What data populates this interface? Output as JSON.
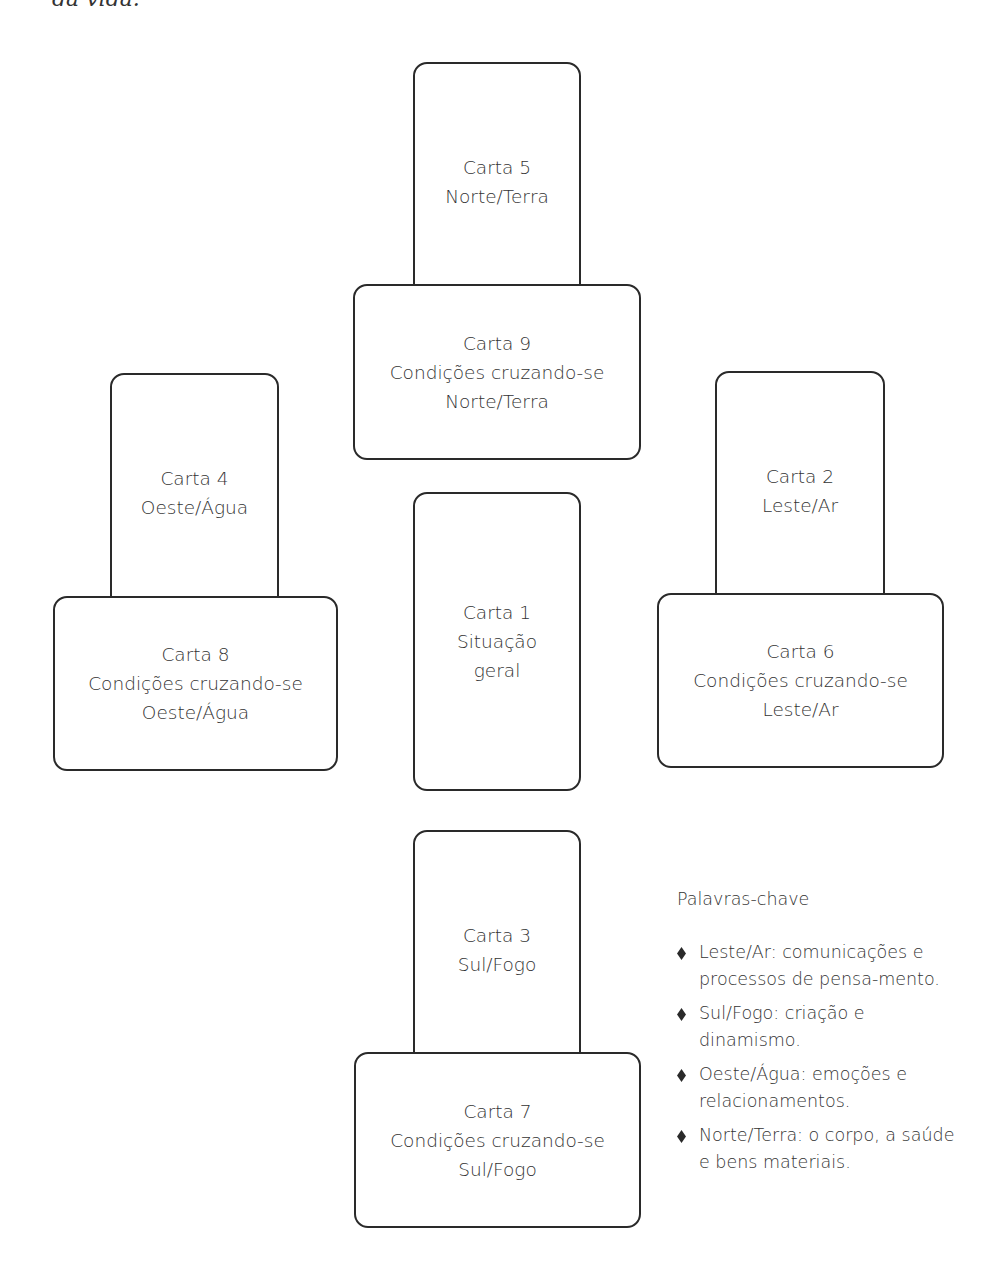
{
  "page": {
    "top_fragment": "da vida."
  },
  "cards": [
    {
      "id": "carta-5",
      "title": "Carta 5",
      "lines": [
        "Norte/Terra"
      ],
      "x": 413,
      "y": 62,
      "w": 168,
      "h": 240,
      "orientation": "vertical"
    },
    {
      "id": "carta-9",
      "title": "Carta 9",
      "lines": [
        "Condições cruzando-se",
        "Norte/Terra"
      ],
      "x": 353,
      "y": 284,
      "w": 288,
      "h": 176,
      "orientation": "horizontal"
    },
    {
      "id": "carta-4",
      "title": "Carta 4",
      "lines": [
        "Oeste/Água"
      ],
      "x": 110,
      "y": 373,
      "w": 169,
      "h": 240,
      "orientation": "vertical"
    },
    {
      "id": "carta-8",
      "title": "Carta 8",
      "lines": [
        "Condições cruzando-se",
        "Oeste/Água"
      ],
      "x": 53,
      "y": 596,
      "w": 285,
      "h": 175,
      "orientation": "horizontal"
    },
    {
      "id": "carta-2",
      "title": "Carta 2",
      "lines": [
        "Leste/Ar"
      ],
      "x": 715,
      "y": 371,
      "w": 170,
      "h": 240,
      "orientation": "vertical"
    },
    {
      "id": "carta-6",
      "title": "Carta 6",
      "lines": [
        "Condições cruzando-se",
        "Leste/Ar"
      ],
      "x": 657,
      "y": 593,
      "w": 287,
      "h": 175,
      "orientation": "horizontal"
    },
    {
      "id": "carta-1",
      "title": "Carta 1",
      "lines": [
        "Situação",
        "geral"
      ],
      "x": 413,
      "y": 492,
      "w": 168,
      "h": 299,
      "orientation": "vertical"
    },
    {
      "id": "carta-3",
      "title": "Carta 3",
      "lines": [
        "Sul/Fogo"
      ],
      "x": 413,
      "y": 830,
      "w": 168,
      "h": 240,
      "orientation": "vertical"
    },
    {
      "id": "carta-7",
      "title": "Carta 7",
      "lines": [
        "Condições cruzando-se",
        "Sul/Fogo"
      ],
      "x": 354,
      "y": 1052,
      "w": 287,
      "h": 176,
      "orientation": "horizontal"
    }
  ],
  "legend": {
    "title": "Palavras-chave",
    "bullet_icon": "diamond-bullet",
    "items": [
      "Leste/Ar: comunicações e processos de pensa-mento.",
      "Sul/Fogo: criação e dinamismo.",
      "Oeste/Água: emoções e relacionamentos.",
      "Norte/Terra: o corpo, a saúde e bens materiais."
    ]
  },
  "colors": {
    "stroke": "#2a2a2a",
    "text": "#333333",
    "background": "#ffffff"
  }
}
